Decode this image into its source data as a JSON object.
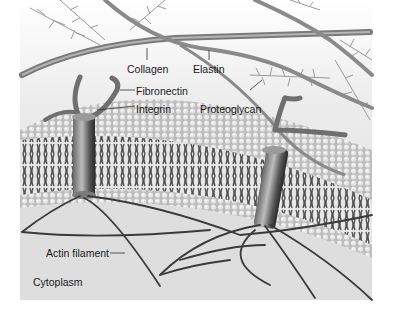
{
  "figure": {
    "labels": {
      "collagen": "Collagen",
      "elastin": "Elastin",
      "fibronectin": "Fibronectin",
      "integrin": "Integrin",
      "proteoglycan": "Proteoglycan",
      "actin_filament": "Actin filament",
      "cytoplasm": "Cytoplasm"
    },
    "colors": {
      "background": "#ffffff",
      "ecm_bg": "#f0f0f0",
      "membrane_surface": "#cfcfcf",
      "fiber": "#8a8a8a",
      "fiber_dark": "#5a5a5a",
      "actin": "#3a3a3a",
      "cytoplasm_bg": "#dedede",
      "text": "#1a1a1a"
    }
  }
}
